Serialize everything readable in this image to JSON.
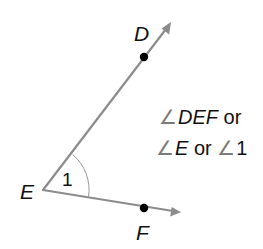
{
  "diagram": {
    "colors": {
      "ray": "#8c8c8c",
      "point": "#000000",
      "text": "#111111",
      "angle_symbol": "#7a7a7a",
      "background": "#ffffff"
    },
    "vertex": {
      "label": "E",
      "x": 43,
      "y": 190
    },
    "rays": [
      {
        "name": "ray-ED",
        "from": "E",
        "through": "D",
        "point": {
          "label": "D",
          "x": 144,
          "y": 57
        },
        "tip": {
          "x": 171,
          "y": 23
        }
      },
      {
        "name": "ray-EF",
        "from": "E",
        "through": "F",
        "point": {
          "label": "F",
          "x": 144,
          "y": 208
        },
        "tip": {
          "x": 181,
          "y": 212
        }
      }
    ],
    "angle_mark": {
      "label": "1"
    },
    "labels": {
      "D": "D",
      "E": "E",
      "F": "F",
      "angle_number": "1"
    },
    "annotation": {
      "line1": {
        "symbol": "∠",
        "name": "DEF",
        "suffix": " or"
      },
      "line2": {
        "symbol1": "∠",
        "name1": "E",
        "middle": " or ",
        "symbol2": "∠",
        "name2": "1"
      }
    }
  }
}
